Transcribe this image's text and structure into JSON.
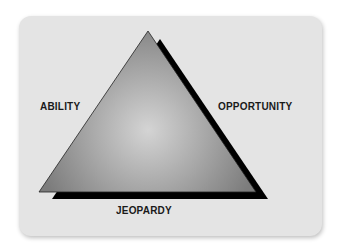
{
  "diagram": {
    "type": "triangle",
    "labels": {
      "left": "ABILITY",
      "right": "OPPORTUNITY",
      "bottom": "JEOPARDY"
    },
    "colors": {
      "panel": "#e4e4e4",
      "triangle_light": "#d0d0d0",
      "triangle_dark": "#7a7a7a",
      "shadow": "#000000"
    }
  }
}
